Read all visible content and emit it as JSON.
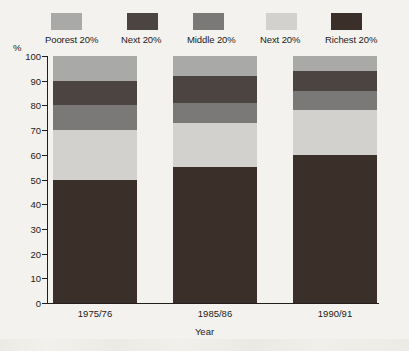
{
  "axis_percent_symbol": "%",
  "legend": {
    "items": [
      {
        "label": "Poorest 20%",
        "color": "#a9a9a7"
      },
      {
        "label": "Next 20%",
        "color": "#4c4441"
      },
      {
        "label": "Middle 20%",
        "color": "#7b7977"
      },
      {
        "label": "Next 20%",
        "color": "#d2d1cd"
      },
      {
        "label": "Richest 20%",
        "color": "#3b3029"
      }
    ]
  },
  "chart_data": {
    "type": "bar",
    "stacked": true,
    "title": "",
    "xlabel": "Year",
    "ylabel": "%",
    "ylim": [
      0,
      100
    ],
    "yticks": [
      0,
      10,
      20,
      30,
      40,
      50,
      60,
      70,
      80,
      90,
      100
    ],
    "grid": false,
    "legend_position": "top",
    "categories": [
      "1975/76",
      "1985/86",
      "1990/91"
    ],
    "series": [
      {
        "name": "Richest 20%",
        "color": "#3b3029",
        "values": [
          50,
          55,
          60
        ]
      },
      {
        "name": "Next 20%",
        "color": "#d2d1cd",
        "values": [
          20,
          18,
          18
        ]
      },
      {
        "name": "Middle 20%",
        "color": "#7b7977",
        "values": [
          10,
          8,
          8
        ]
      },
      {
        "name": "Next 20%",
        "color": "#4c4441",
        "values": [
          10,
          11,
          8
        ]
      },
      {
        "name": "Poorest 20%",
        "color": "#a9a9a7",
        "values": [
          10,
          8,
          6
        ]
      }
    ]
  }
}
